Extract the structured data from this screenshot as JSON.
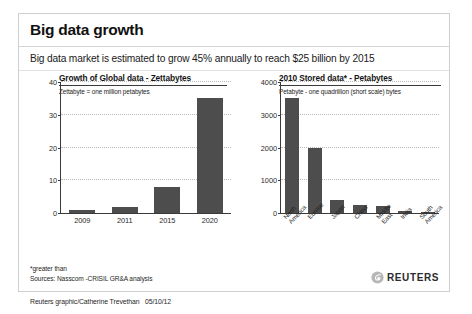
{
  "header": {
    "title": "Big data growth"
  },
  "subhead": {
    "text": "Big data market is estimated to grow 45% annually to reach $25 billion by 2015"
  },
  "footnotes": {
    "line1": "*greater than",
    "line2": "Sources: Nasscom -CRISIL GR&A analysis"
  },
  "logo": {
    "wordmark": "REUTERS",
    "mark_icon": "reuters-swoosh-icon"
  },
  "credit": {
    "text": "Reuters graphic/Catherine Trevethan   05/10/12"
  },
  "colors": {
    "bar": "#4d4d4d",
    "axis": "#3a3a3a",
    "gridline": "#b9b9b9",
    "frame": "#cfcfcf"
  },
  "chart_data": [
    {
      "type": "bar",
      "id": "global-data-growth",
      "title": "Growth of Global data - Zettabytes",
      "subtitle": "Zettabyte = one million petabytes",
      "xlabel": "",
      "ylabel": "",
      "ylim": [
        0,
        40
      ],
      "yticks": [
        40,
        30,
        20,
        10,
        0
      ],
      "grid": true,
      "legend": false,
      "categories": [
        "2009",
        "2011",
        "2015",
        "2020"
      ],
      "values": [
        0.8,
        1.8,
        8,
        35
      ]
    },
    {
      "type": "bar",
      "id": "stored-data-2010",
      "title": "2010 Stored data* - Petabytes",
      "subtitle": "Petabyte - one quadrillion (short scale) bytes",
      "xlabel": "",
      "ylabel": "",
      "ylim": [
        0,
        4000
      ],
      "yticks": [
        4000,
        3000,
        2000,
        1000,
        0
      ],
      "grid": true,
      "legend": false,
      "categories": [
        "North\nAmerica",
        "Europe",
        "Japan",
        "China",
        "Middle\nEast",
        "India",
        "South\nAmerica"
      ],
      "values": [
        3500,
        2000,
        400,
        250,
        200,
        50,
        40
      ]
    }
  ]
}
